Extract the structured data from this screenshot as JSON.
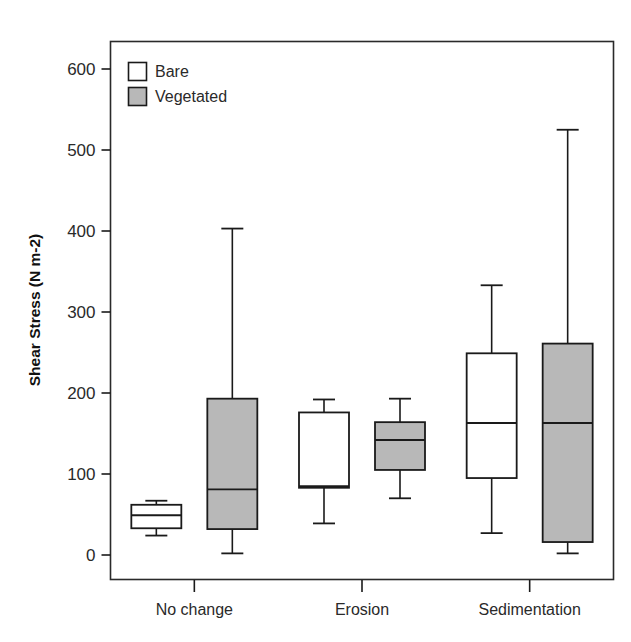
{
  "chart_data": {
    "type": "box",
    "title": "",
    "xlabel": "",
    "ylabel": "Shear Stress (N m-2)",
    "ylim": [
      0,
      640
    ],
    "yticks": [
      0,
      100,
      200,
      300,
      400,
      500,
      600
    ],
    "ytick_labels": [
      "0",
      "100",
      "200",
      "300",
      "400",
      "500",
      "600"
    ],
    "grid": false,
    "categories": [
      "No change",
      "Erosion",
      "Sedimentation"
    ],
    "legend": {
      "position": "top-left-inside",
      "entries": [
        {
          "label": "Bare",
          "fill": "#ffffff",
          "stroke": "#1a1a1a"
        },
        {
          "label": "Vegetated",
          "fill": "#b8b8b8",
          "stroke": "#1a1a1a"
        }
      ]
    },
    "series": [
      {
        "name": "Bare",
        "fill": "#ffffff",
        "boxes": [
          {
            "category": "No change",
            "whisker_low": 24,
            "q1": 33,
            "median": 49,
            "q3": 62,
            "whisker_high": 67
          },
          {
            "category": "Erosion",
            "whisker_low": 39,
            "q1": 83,
            "median": 85,
            "q3": 176,
            "whisker_high": 192
          },
          {
            "category": "Sedimentation",
            "whisker_low": 27,
            "q1": 95,
            "median": 163,
            "q3": 249,
            "whisker_high": 333
          }
        ]
      },
      {
        "name": "Vegetated",
        "fill": "#b8b8b8",
        "boxes": [
          {
            "category": "No change",
            "whisker_low": 2,
            "q1": 32,
            "median": 81,
            "q3": 193,
            "whisker_high": 403
          },
          {
            "category": "Erosion",
            "whisker_low": 70,
            "q1": 105,
            "median": 142,
            "q3": 164,
            "whisker_high": 193
          },
          {
            "category": "Sedimentation",
            "whisker_low": 2,
            "q1": 16,
            "median": 163,
            "q3": 261,
            "whisker_high": 525
          }
        ]
      }
    ]
  },
  "axes": {
    "y_title": "Shear Stress (N m-2)",
    "y_tick_0": "0",
    "y_tick_100": "100",
    "y_tick_200": "200",
    "y_tick_300": "300",
    "y_tick_400": "400",
    "y_tick_500": "500",
    "y_tick_600": "600"
  },
  "categories": {
    "c0": "No change",
    "c1": "Erosion",
    "c2": "Sedimentation"
  },
  "legend": {
    "item0": "Bare",
    "item1": "Vegetated"
  },
  "colors": {
    "bare_fill": "#ffffff",
    "vegetated_fill": "#b8b8b8",
    "line": "#1a1a1a",
    "background": "#ffffff"
  }
}
